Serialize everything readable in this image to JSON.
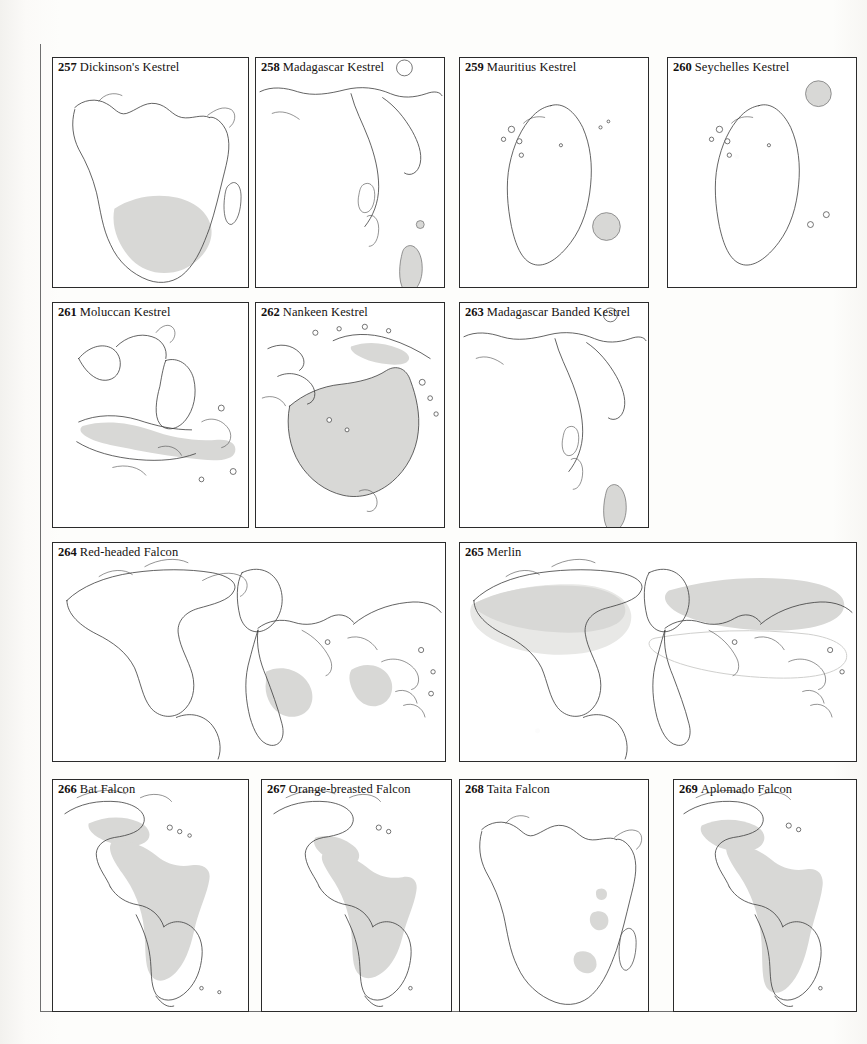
{
  "page": {
    "kind": "field-guide-distribution-map-plate",
    "background_color": "#fdfdfb",
    "panel_border_color": "#2b2b2b",
    "range_fill_color": "#d8d8d6",
    "coastline_color": "#3a3a3a",
    "panel_count": 13
  },
  "panels": [
    {
      "number": "257",
      "name": "Dickinson's Kestrel",
      "region": "Africa",
      "range_note": "shaded band across south-central Africa",
      "row": 1,
      "col": 1
    },
    {
      "number": "258",
      "name": "Madagascar Kestrel",
      "region": "Africa and Madagascar",
      "range_note": "shaded Madagascar and small Comoro islands",
      "row": 1,
      "col": 2
    },
    {
      "number": "259",
      "name": "Mauritius Kestrel",
      "region": "Madagascar and western Indian Ocean",
      "range_note": "shaded circle marking Mauritius east of Madagascar",
      "row": 1,
      "col": 3
    },
    {
      "number": "260",
      "name": "Seychelles Kestrel",
      "region": "Madagascar and western Indian Ocean",
      "range_note": "shaded circle marking the Seychelles north-east of Madagascar",
      "row": 1,
      "col": 4
    },
    {
      "number": "261",
      "name": "Moluccan Kestrel",
      "region": "South-east Asia and Indonesia",
      "range_note": "shaded band through Java, Lesser Sundas and the Moluccas",
      "row": 2,
      "col": 1
    },
    {
      "number": "262",
      "name": "Nankeen Kestrel",
      "region": "Australia and New Guinea",
      "range_note": "whole of Australia shaded, plus southern New Guinea",
      "row": 2,
      "col": 2
    },
    {
      "number": "263",
      "name": "Madagascar Banded Kestrel",
      "region": "Africa and Madagascar",
      "range_note": "Madagascar shaded",
      "row": 2,
      "col": 3
    },
    {
      "number": "264",
      "name": "Red-headed Falcon",
      "region": "World",
      "range_note": "sub-Saharan Africa and the Indian subcontinent shaded",
      "row": 3,
      "col": 1
    },
    {
      "number": "265",
      "name": "Merlin",
      "region": "World",
      "range_note": "boreal breeding band across North America and Eurasia with paler wintering range southward",
      "row": 3,
      "col": 2
    },
    {
      "number": "266",
      "name": "Bat Falcon",
      "region": "The Americas",
      "range_note": "Mexico through Central America and tropical South America shaded",
      "row": 4,
      "col": 1
    },
    {
      "number": "267",
      "name": "Orange-breasted Falcon",
      "region": "The Americas",
      "range_note": "southern Mexico through Amazonia shaded",
      "row": 4,
      "col": 2
    },
    {
      "number": "268",
      "name": "Taita Falcon",
      "region": "Africa",
      "range_note": "small shaded patches in east and south-central Africa",
      "row": 4,
      "col": 3
    },
    {
      "number": "269",
      "name": "Aplomado Falcon",
      "region": "The Americas",
      "range_note": "south-west United States through Mexico and most of South America shaded",
      "row": 4,
      "col": 4
    }
  ]
}
